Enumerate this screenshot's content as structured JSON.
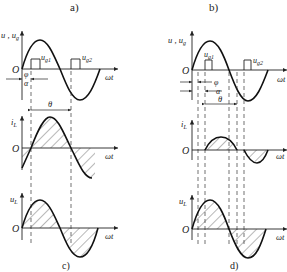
{
  "panel_labels": {
    "a": "a)",
    "b": "b)",
    "c": "c)",
    "d": "d)"
  },
  "panels": {
    "c": {
      "top": {
        "ylabel": "u , u",
        "ylabel_sub": "g",
        "origin": "O",
        "xlabel": "ωt",
        "pulse1_label": "u",
        "pulse1_sub": "g1",
        "pulse2_label": "u",
        "pulse2_sub": "g2",
        "phi_label": "φ",
        "alpha_label": "α"
      },
      "middle": {
        "ylabel": "i",
        "ylabel_sub": "L",
        "origin": "O",
        "xlabel": "ωt",
        "theta_label": "θ"
      },
      "bottom": {
        "ylabel": "u",
        "ylabel_sub": "L",
        "origin": "O",
        "xlabel": "ωt"
      }
    },
    "d": {
      "top": {
        "ylabel": "u , u",
        "ylabel_sub": "g",
        "origin": "O",
        "xlabel": "ωt",
        "pulse1_label": "u",
        "pulse1_sub": "g1",
        "pulse2_label": "u",
        "pulse2_sub": "g2",
        "phi_label": "φ",
        "alpha_label": "α",
        "theta_label": "θ"
      },
      "middle": {
        "ylabel": "i",
        "ylabel_sub": "L",
        "origin": "O",
        "xlabel": "ωt"
      },
      "bottom": {
        "ylabel": "u",
        "ylabel_sub": "L",
        "origin": "O",
        "xlabel": "ωt"
      }
    }
  }
}
